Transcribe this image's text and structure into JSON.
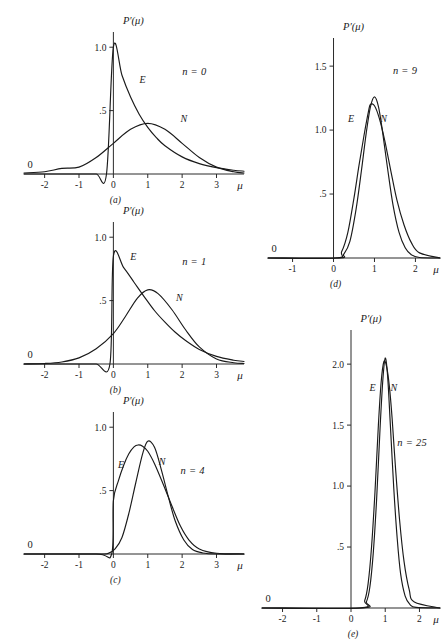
{
  "figure": {
    "axis_y_title": "P′(μ)",
    "axis_x_title": "μ",
    "zero_origin_label": "0",
    "curve_labels": {
      "exponential": "E",
      "normal": "N"
    }
  },
  "chart_data": {
    "type": "line",
    "title": "P′(μ)",
    "xlabel": "μ",
    "ylabel": "P′(μ)",
    "grid": false,
    "legend": "inline-curve-labels",
    "panels": [
      {
        "id": "a",
        "panel_label": "(a)",
        "annotation": "n = 0",
        "n": 0,
        "xlim": [
          -2.6,
          3.8
        ],
        "ylim": [
          0,
          1.12
        ],
        "xticks": [
          -2,
          -1,
          0,
          1,
          2,
          3
        ],
        "xticklabels": [
          "-2",
          "-1",
          "0",
          "1",
          "2",
          "3"
        ],
        "yticks": [
          0.5,
          1.0
        ],
        "yticklabels": [
          ".5",
          "1.0"
        ],
        "series": [
          {
            "name": "E",
            "kind": "exponential",
            "label": "E",
            "label_at": {
              "x": 0.85,
              "y": 0.72
            },
            "peak": {
              "x": 0.0,
              "y": 1.0
            },
            "points_x": [
              -2.6,
              -2.0,
              -1.5,
              -1.0,
              -0.5,
              -0.2,
              0.0,
              0.25,
              0.5,
              0.75,
              1.0,
              1.25,
              1.5,
              2.0,
              2.5,
              3.0,
              3.5,
              3.8
            ],
            "points_y": [
              0.0,
              0.0,
              0.0,
              0.0,
              0.0,
              0.0,
              1.0,
              0.779,
              0.607,
              0.472,
              0.368,
              0.287,
              0.223,
              0.135,
              0.082,
              0.05,
              0.03,
              0.022
            ]
          },
          {
            "name": "N",
            "kind": "normal",
            "label": "N",
            "label_at": {
              "x": 2.05,
              "y": 0.41
            },
            "peak": {
              "x": 1.0,
              "y": 0.399
            },
            "points_x": [
              -2.6,
              -2.0,
              -1.5,
              -1.0,
              -0.5,
              0.0,
              0.5,
              1.0,
              1.5,
              2.0,
              2.5,
              3.0,
              3.5,
              3.8
            ],
            "points_y": [
              0.008,
              0.018,
              0.044,
              0.054,
              0.13,
              0.242,
              0.352,
              0.399,
              0.352,
              0.242,
              0.13,
              0.054,
              0.018,
              0.008
            ]
          }
        ]
      },
      {
        "id": "b",
        "panel_label": "(b)",
        "annotation": "n = 1",
        "n": 1,
        "xlim": [
          -2.6,
          3.8
        ],
        "ylim": [
          0,
          1.12
        ],
        "xticks": [
          -2,
          -1,
          0,
          1,
          2,
          3
        ],
        "xticklabels": [
          "-2",
          "-1",
          "0",
          "1",
          "2",
          "3"
        ],
        "yticks": [
          0.5,
          1.0
        ],
        "yticklabels": [
          ".5",
          "1.0"
        ],
        "series": [
          {
            "name": "E",
            "kind": "gamma",
            "label": "E",
            "label_at": {
              "x": 0.58,
              "y": 0.82
            },
            "peak": {
              "x": 0.0,
              "y": 0.85
            },
            "points_x": [
              -2.6,
              -1.5,
              -1.0,
              -0.5,
              -0.1,
              0.0,
              0.3,
              0.6,
              0.9,
              1.2,
              1.5,
              1.8,
              2.1,
              2.5,
              3.0,
              3.5,
              3.8
            ],
            "points_y": [
              0.0,
              0.0,
              0.0,
              0.0,
              0.0,
              0.85,
              0.76,
              0.645,
              0.53,
              0.42,
              0.33,
              0.25,
              0.185,
              0.115,
              0.06,
              0.03,
              0.02
            ]
          },
          {
            "name": "N",
            "kind": "normal",
            "label": "N",
            "label_at": {
              "x": 1.92,
              "y": 0.5
            },
            "peak": {
              "x": 1.0,
              "y": 0.585
            },
            "points_x": [
              -2.6,
              -2.0,
              -1.5,
              -1.0,
              -0.5,
              0.0,
              0.35,
              0.7,
              1.0,
              1.3,
              1.7,
              2.1,
              2.5,
              3.0,
              3.5,
              3.8
            ],
            "points_y": [
              0.0,
              0.004,
              0.016,
              0.048,
              0.12,
              0.24,
              0.375,
              0.52,
              0.585,
              0.555,
              0.43,
              0.27,
              0.135,
              0.04,
              0.01,
              0.004
            ]
          }
        ]
      },
      {
        "id": "c",
        "panel_label": "(c)",
        "annotation": "n = 4",
        "n": 4,
        "xlim": [
          -2.6,
          3.8
        ],
        "ylim": [
          0,
          1.12
        ],
        "xticks": [
          -2,
          -1,
          0,
          1,
          2,
          3
        ],
        "xticklabels": [
          "-2",
          "-1",
          "0",
          "1",
          "2",
          "3"
        ],
        "yticks": [
          0.5,
          1.0
        ],
        "yticklabels": [
          ".5",
          "1.0"
        ],
        "series": [
          {
            "name": "E",
            "kind": "gamma",
            "label": "E",
            "label_at": {
              "x": 0.22,
              "y": 0.68
            },
            "peak": {
              "x": 0.72,
              "y": 0.86
            },
            "points_x": [
              -2.6,
              -0.5,
              -0.05,
              0.0,
              0.15,
              0.3,
              0.45,
              0.6,
              0.72,
              0.85,
              1.0,
              1.2,
              1.45,
              1.7,
              1.95,
              2.2,
              2.5,
              3.0,
              3.8
            ],
            "points_y": [
              0.0,
              0.0,
              0.0,
              0.42,
              0.58,
              0.7,
              0.79,
              0.845,
              0.86,
              0.85,
              0.81,
              0.71,
              0.55,
              0.38,
              0.22,
              0.11,
              0.04,
              0.006,
              0.0
            ]
          },
          {
            "name": "N",
            "kind": "normal",
            "label": "N",
            "label_at": {
              "x": 1.42,
              "y": 0.7
            },
            "peak": {
              "x": 1.0,
              "y": 0.89
            },
            "points_x": [
              -2.6,
              -0.5,
              -0.15,
              0.05,
              0.25,
              0.45,
              0.65,
              0.85,
              1.0,
              1.2,
              1.4,
              1.6,
              1.8,
              2.05,
              2.3,
              2.6,
              3.0,
              3.8
            ],
            "points_y": [
              0.0,
              0.0,
              0.005,
              0.04,
              0.13,
              0.32,
              0.56,
              0.79,
              0.89,
              0.84,
              0.66,
              0.45,
              0.26,
              0.11,
              0.035,
              0.008,
              0.0,
              0.0
            ]
          }
        ]
      },
      {
        "id": "d",
        "panel_label": "(d)",
        "annotation": "n = 9",
        "n": 9,
        "xlim": [
          -1.6,
          2.6
        ],
        "ylim": [
          0,
          1.72
        ],
        "xticks": [
          -1,
          0,
          1,
          2
        ],
        "xticklabels": [
          "-1",
          "0",
          "1",
          "2"
        ],
        "yticks": [
          0.5,
          1.0,
          1.5
        ],
        "yticklabels": [
          ".5",
          "1.0",
          "1.5"
        ],
        "series": [
          {
            "name": "E",
            "kind": "gamma",
            "label": "E",
            "label_at": {
              "x": 0.43,
              "y": 1.06
            },
            "peak": {
              "x": 0.9,
              "y": 1.2
            },
            "points_x": [
              -1.6,
              0.05,
              0.2,
              0.35,
              0.5,
              0.62,
              0.74,
              0.85,
              0.9,
              1.0,
              1.12,
              1.25,
              1.4,
              1.55,
              1.72,
              1.9,
              2.1,
              2.6
            ],
            "points_y": [
              0.0,
              0.0,
              0.05,
              0.2,
              0.47,
              0.72,
              0.95,
              1.14,
              1.2,
              1.19,
              1.09,
              0.92,
              0.68,
              0.45,
              0.26,
              0.12,
              0.04,
              0.0
            ]
          },
          {
            "name": "N",
            "kind": "normal",
            "label": "N",
            "label_at": {
              "x": 1.22,
              "y": 1.06
            },
            "peak": {
              "x": 1.0,
              "y": 1.26
            },
            "points_x": [
              -1.6,
              0.1,
              0.25,
              0.4,
              0.55,
              0.68,
              0.8,
              0.9,
              1.0,
              1.1,
              1.2,
              1.32,
              1.45,
              1.6,
              1.75,
              1.9,
              2.1,
              2.6
            ],
            "points_y": [
              0.0,
              0.0,
              0.03,
              0.13,
              0.38,
              0.68,
              0.98,
              1.18,
              1.26,
              1.18,
              0.98,
              0.7,
              0.42,
              0.2,
              0.08,
              0.025,
              0.004,
              0.0
            ]
          }
        ]
      },
      {
        "id": "e",
        "panel_label": "(e)",
        "annotation": "n = 25",
        "n": 25,
        "xlim": [
          -2.6,
          2.6
        ],
        "ylim": [
          0,
          2.28
        ],
        "xticks": [
          -2,
          -1,
          0,
          1,
          2
        ],
        "xticklabels": [
          "-2",
          "-1",
          "0",
          "1",
          "2"
        ],
        "yticks": [
          0.5,
          1.0,
          1.5,
          2.0
        ],
        "yticklabels": [
          ".5",
          "1.0",
          "1.5",
          "2.0"
        ],
        "series": [
          {
            "name": "E",
            "kind": "gamma",
            "label": "E",
            "label_at": {
              "x": 0.63,
              "y": 1.78
            },
            "peak": {
              "x": 0.96,
              "y": 2.02
            },
            "points_x": [
              -2.6,
              0.25,
              0.4,
              0.5,
              0.6,
              0.7,
              0.8,
              0.88,
              0.96,
              1.04,
              1.12,
              1.2,
              1.3,
              1.42,
              1.55,
              1.7,
              1.85,
              2.6
            ],
            "points_y": [
              0.0,
              0.0,
              0.06,
              0.2,
              0.5,
              0.95,
              1.5,
              1.85,
              2.02,
              1.98,
              1.82,
              1.56,
              1.15,
              0.72,
              0.38,
              0.15,
              0.05,
              0.0
            ]
          },
          {
            "name": "N",
            "kind": "normal",
            "label": "N",
            "label_at": {
              "x": 1.25,
              "y": 1.78
            },
            "peak": {
              "x": 1.0,
              "y": 2.05
            },
            "points_x": [
              -2.6,
              0.3,
              0.45,
              0.55,
              0.65,
              0.75,
              0.85,
              0.93,
              1.0,
              1.07,
              1.15,
              1.25,
              1.35,
              1.45,
              1.58,
              1.72,
              1.9,
              2.6
            ],
            "points_y": [
              0.0,
              0.0,
              0.05,
              0.17,
              0.45,
              0.9,
              1.48,
              1.87,
              2.05,
              1.9,
              1.5,
              0.98,
              0.57,
              0.28,
              0.1,
              0.03,
              0.005,
              0.0
            ]
          }
        ]
      }
    ]
  }
}
